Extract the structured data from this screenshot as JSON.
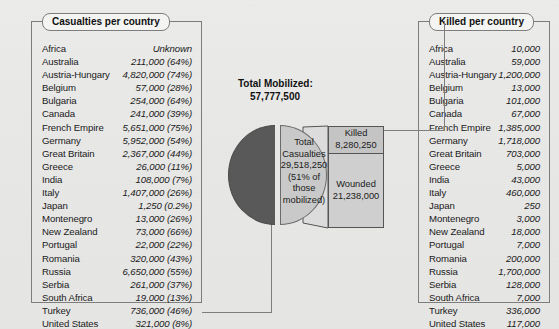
{
  "left_callout": {
    "title": "Casualties per country",
    "columns": [
      "Country",
      "Casualties"
    ],
    "rows": [
      {
        "name": "Africa",
        "value": "Unknown"
      },
      {
        "name": "Australia",
        "value": "211,000 (64%)"
      },
      {
        "name": "Austria-Hungary",
        "value": "4,820,000 (74%)"
      },
      {
        "name": "Belgium",
        "value": "57,000 (28%)"
      },
      {
        "name": "Bulgaria",
        "value": "254,000 (64%)"
      },
      {
        "name": "Canada",
        "value": "241,000 (39%)"
      },
      {
        "name": "French Empire",
        "value": "5,651,000 (75%)"
      },
      {
        "name": "Germany",
        "value": "5,952,000 (54%)"
      },
      {
        "name": "Great Britain",
        "value": "2,367,000 (44%)"
      },
      {
        "name": "Greece",
        "value": "26,000 (11%)"
      },
      {
        "name": "India",
        "value": "108,000 (7%)"
      },
      {
        "name": "Italy",
        "value": "1,407,000 (26%)"
      },
      {
        "name": "Japan",
        "value": "1,250 (0.2%)"
      },
      {
        "name": "Montenegro",
        "value": "13,000 (26%)"
      },
      {
        "name": "New Zealand",
        "value": "73,000 (66%)"
      },
      {
        "name": "Portugal",
        "value": "22,000 (22%)"
      },
      {
        "name": "Romania",
        "value": "320,000 (43%)"
      },
      {
        "name": "Russia",
        "value": "6,650,000 (55%)"
      },
      {
        "name": "Serbia",
        "value": "261,000 (37%)"
      },
      {
        "name": "South Africa",
        "value": "19,000 (13%)"
      },
      {
        "name": "Turkey",
        "value": "736,000 (46%)"
      },
      {
        "name": "United States",
        "value": "321,000 (8%)"
      }
    ]
  },
  "right_callout": {
    "title": "Killed per country",
    "columns": [
      "Country",
      "Killed"
    ],
    "rows": [
      {
        "name": "Africa",
        "value": "10,000"
      },
      {
        "name": "Australia",
        "value": "59,000"
      },
      {
        "name": "Austria-Hungary",
        "value": "1,200,000"
      },
      {
        "name": "Belgium",
        "value": "13,000"
      },
      {
        "name": "Bulgaria",
        "value": "101,000"
      },
      {
        "name": "Canada",
        "value": "67,000"
      },
      {
        "name": "French Empire",
        "value": "1,385,000"
      },
      {
        "name": "Germany",
        "value": "1,718,000"
      },
      {
        "name": "Great Britain",
        "value": "703,000"
      },
      {
        "name": "Greece",
        "value": "5,000"
      },
      {
        "name": "India",
        "value": "43,000"
      },
      {
        "name": "Italy",
        "value": "460,000"
      },
      {
        "name": "Japan",
        "value": "250"
      },
      {
        "name": "Montenegro",
        "value": "3,000"
      },
      {
        "name": "New Zealand",
        "value": "18,000"
      },
      {
        "name": "Portugal",
        "value": "7,000"
      },
      {
        "name": "Romania",
        "value": "200,000"
      },
      {
        "name": "Russia",
        "value": "1,700,000"
      },
      {
        "name": "Serbia",
        "value": "128,000"
      },
      {
        "name": "South Africa",
        "value": "7,000"
      },
      {
        "name": "Turkey",
        "value": "336,000"
      },
      {
        "name": "United States",
        "value": "117,000"
      }
    ]
  },
  "chart": {
    "title": "Total Mobilized:",
    "total": "57,777,500",
    "pie_slice_label": "Total Casualties 29,518,250 (51% of those mobilized)",
    "bar": {
      "killed_label": "Killed",
      "killed_value": "8,280,250",
      "wounded_label": "Wounded",
      "wounded_value": "21,238,000"
    }
  },
  "chart_data": {
    "type": "pie",
    "title": "Total Mobilized: 57,777,500",
    "subtitle": "",
    "total": 57777500,
    "labels": [
      "Total Casualties",
      "Not casualties"
    ],
    "values": [
      29518250,
      28259250
    ],
    "percentages": [
      51,
      49
    ],
    "colors": [
      "#c9c9c9",
      "#595959"
    ],
    "exploded": [
      "Total Casualties"
    ],
    "legend": "none",
    "secondary_plot": {
      "type": "bar",
      "orientation": "stacked-vertical",
      "source_slice": "Total Casualties",
      "categories": [
        "Killed",
        "Wounded"
      ],
      "values": [
        8280250,
        21238000
      ],
      "colors": [
        "#c4c4c4",
        "#cfcfcf"
      ]
    },
    "annotations": [
      "Total Casualties 29,518,250 (51% of those mobilized)",
      "Killed 8,280,250",
      "Wounded 21,238,000"
    ]
  }
}
